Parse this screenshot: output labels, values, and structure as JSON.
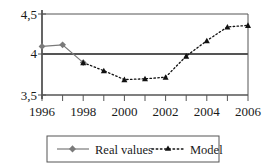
{
  "chart_data": {
    "type": "line",
    "title": "",
    "xlabel": "",
    "ylabel": "",
    "x": [
      1996,
      1997,
      1998,
      1999,
      2000,
      2001,
      2002,
      2003,
      2004,
      2005,
      2006
    ],
    "categories": [
      "1996",
      "1997",
      "1998",
      "1999",
      "2000",
      "2001",
      "2002",
      "2003",
      "2004",
      "2005",
      "2006"
    ],
    "xlim": [
      1996,
      2006
    ],
    "ylim": [
      3.5,
      4.5
    ],
    "yticks": [
      3.5,
      4.0,
      4.5
    ],
    "ytick_labels": [
      "3,5",
      "4",
      "4,5"
    ],
    "xtick_labels": [
      "1996",
      "1998",
      "2000",
      "2002",
      "2004",
      "2006"
    ],
    "xticks_all": [
      1996,
      1997,
      1998,
      1999,
      2000,
      2001,
      2002,
      2003,
      2004,
      2005,
      2006
    ],
    "grid": "horizontal-at-4",
    "legend_position": "bottom",
    "series": [
      {
        "name": "Real values",
        "style": "solid",
        "marker": "diamond",
        "color": "#7a7a7a",
        "x": [
          1996,
          1997,
          1998
        ],
        "values": [
          4.1,
          4.12,
          3.9
        ]
      },
      {
        "name": "Model",
        "style": "dotted",
        "marker": "triangle",
        "color": "#111111",
        "x": [
          1998,
          1999,
          2000,
          2001,
          2002,
          2003,
          2004,
          2005,
          2006
        ],
        "values": [
          3.9,
          3.8,
          3.69,
          3.7,
          3.72,
          3.98,
          4.17,
          4.34,
          4.36
        ]
      }
    ]
  },
  "axis": {
    "y_labels": [
      "4,5",
      "4",
      "3,5"
    ],
    "x_labels": [
      "1996",
      "1998",
      "2000",
      "2002",
      "2004",
      "2006"
    ]
  },
  "legend": {
    "items": [
      {
        "label": "Real values",
        "marker": "diamond-marker",
        "line": "solid"
      },
      {
        "label": "Model",
        "marker": "triangle-marker",
        "line": "dotted"
      }
    ]
  },
  "colors": {
    "real_values": "#7a7a7a",
    "model": "#111111",
    "axis": "#555555",
    "background": "#ffffff"
  }
}
